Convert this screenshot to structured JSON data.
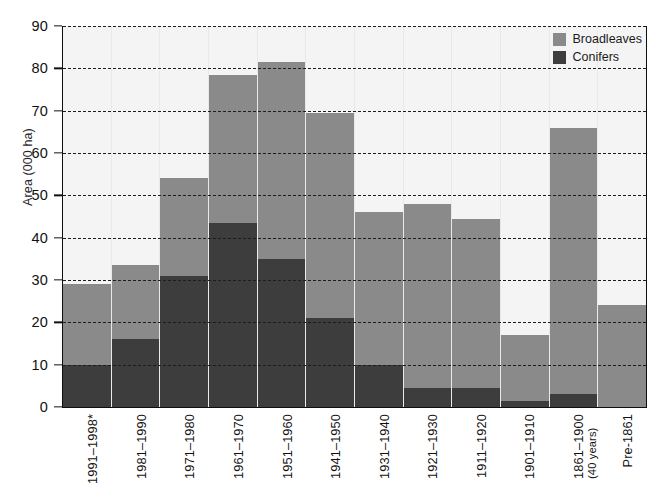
{
  "chart_data": {
    "type": "bar",
    "title": "",
    "subtitle": "",
    "xlabel": "",
    "ylabel": "Area (000 ha)",
    "ylim": [
      0,
      90
    ],
    "yticks": [
      0,
      10,
      20,
      30,
      40,
      50,
      60,
      70,
      80,
      90
    ],
    "grid": true,
    "stacked": true,
    "legend_position": "top-right",
    "categories": [
      "1991–1998*",
      "1981–1990",
      "1971–1980",
      "1961–1970",
      "1951–1960",
      "1941–1950",
      "1931–1940",
      "1921–1930",
      "1911–1920",
      "1901–1910",
      "1861–1900",
      "Pre-1861"
    ],
    "category_sublabels": [
      "",
      "",
      "",
      "",
      "",
      "",
      "",
      "",
      "",
      "",
      "(40 years)",
      ""
    ],
    "series": [
      {
        "name": "Conifers",
        "color": "#3d3d3d",
        "values": [
          10.0,
          16.0,
          31.0,
          43.5,
          35.0,
          21.0,
          10.0,
          4.5,
          4.5,
          1.5,
          3.0,
          0.0
        ]
      },
      {
        "name": "Broadleaves",
        "color": "#8a8a8a",
        "values": [
          19.0,
          17.5,
          23.0,
          35.0,
          46.5,
          48.5,
          36.0,
          43.5,
          40.0,
          15.5,
          63.0,
          24.0
        ]
      }
    ],
    "totals": [
      29.0,
      33.5,
      54.0,
      78.5,
      81.5,
      69.5,
      46.0,
      48.0,
      44.5,
      17.0,
      66.0,
      24.0
    ],
    "annotations": []
  },
  "legend": {
    "items": [
      {
        "label": "Broadleaves",
        "color": "#8a8a8a"
      },
      {
        "label": "Conifers",
        "color": "#3d3d3d"
      }
    ]
  },
  "axes": {
    "y_title": "Area (000 ha)",
    "y_tick_labels": [
      "0",
      "10",
      "20",
      "30",
      "40",
      "50",
      "60",
      "70",
      "80",
      "90"
    ]
  }
}
